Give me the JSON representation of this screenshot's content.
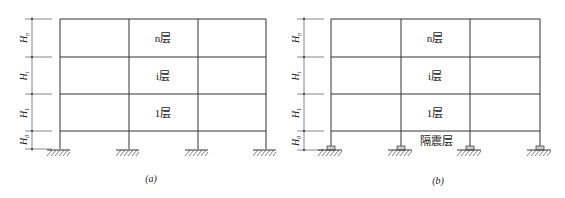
{
  "figure": {
    "panels": [
      {
        "id": "a",
        "caption": "(a)",
        "floors": [
          {
            "label": "n层"
          },
          {
            "label": "i层"
          },
          {
            "label": "1层"
          }
        ],
        "isolation_label": null,
        "dimensions": [
          "Hn",
          "Hi",
          "H1",
          "H0"
        ],
        "support_type": "fixed"
      },
      {
        "id": "b",
        "caption": "(b)",
        "floors": [
          {
            "label": "n层"
          },
          {
            "label": "i层"
          },
          {
            "label": "1层"
          }
        ],
        "isolation_label": "隔震层",
        "dimensions": [
          "Hn",
          "Hi",
          "H1",
          "H0"
        ],
        "support_type": "isolator-bearing"
      }
    ],
    "dim_subscripts": [
      "n",
      "i",
      "1",
      "0"
    ]
  }
}
